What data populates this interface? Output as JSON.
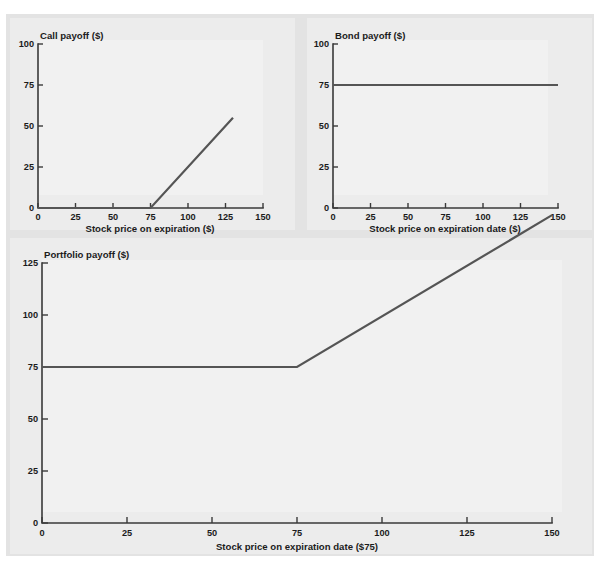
{
  "figure": {
    "background_color": "#e3e3e3",
    "page_color": "#ffffff",
    "line_color": "#555555",
    "axis_color": "#3a3a3a",
    "plot_face_color": "#ececec"
  },
  "chart_data": [
    {
      "id": "call-payoff",
      "type": "line",
      "title": "Call payoff ($)",
      "xlabel": "Stock price on expiration ($)",
      "ylabel": "Call payoff ($)",
      "xlim": [
        0,
        150
      ],
      "ylim": [
        0,
        100
      ],
      "xticks": [
        0,
        25,
        50,
        75,
        100,
        125,
        150
      ],
      "xtick_labels": [
        "0",
        "25",
        "50",
        "75",
        "100",
        "125",
        "150"
      ],
      "yticks": [
        0,
        25,
        50,
        75,
        100
      ],
      "ytick_labels": [
        "0",
        "25",
        "50",
        "75",
        "100"
      ],
      "grid": false,
      "legend": "none",
      "strike": 75,
      "series": [
        {
          "name": "Call payoff",
          "x": [
            0,
            75,
            130
          ],
          "values": [
            0,
            0,
            55
          ]
        }
      ]
    },
    {
      "id": "bond-payoff",
      "type": "line",
      "title": "Bond payoff ($)",
      "xlabel": "Stock price on expiration date ($)",
      "ylabel": "Bond payoff ($)",
      "xlim": [
        0,
        150
      ],
      "ylim": [
        0,
        100
      ],
      "xticks": [
        0,
        25,
        50,
        75,
        100,
        125,
        150
      ],
      "xtick_labels": [
        "0",
        "25",
        "50",
        "75",
        "100",
        "125",
        "150"
      ],
      "yticks": [
        0,
        25,
        50,
        75,
        100
      ],
      "ytick_labels": [
        "0",
        "25",
        "50",
        "75",
        "100"
      ],
      "grid": false,
      "legend": "none",
      "face_value": 75,
      "series": [
        {
          "name": "Bond payoff",
          "x": [
            0,
            150
          ],
          "values": [
            75,
            75
          ]
        }
      ]
    },
    {
      "id": "portfolio-payoff",
      "type": "line",
      "title": "Portfolio payoff ($)",
      "xlabel": "Stock price on expiration date ($75)",
      "ylabel": "Portfolio payoff ($)",
      "xlim": [
        0,
        150
      ],
      "ylim": [
        0,
        125
      ],
      "xticks": [
        0,
        25,
        50,
        75,
        100,
        125,
        150
      ],
      "xtick_labels": [
        "0",
        "25",
        "50",
        "75",
        "100",
        "125",
        "150"
      ],
      "yticks": [
        0,
        25,
        50,
        75,
        100,
        125
      ],
      "ytick_labels": [
        "0",
        "25",
        "50",
        "75",
        "100",
        "125"
      ],
      "grid": false,
      "legend": "none",
      "strike": 75,
      "series": [
        {
          "name": "Portfolio payoff",
          "x": [
            0,
            75,
            150
          ],
          "values": [
            75,
            75,
            148
          ]
        }
      ]
    }
  ]
}
